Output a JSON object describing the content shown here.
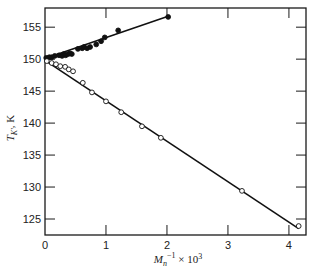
{
  "chart_data": {
    "type": "scatter",
    "title": "",
    "xlabel": "M_n^-1 × 10^3",
    "xlabel_parts": {
      "base": "M",
      "sub": "n",
      "sup": "−1",
      "rest": " × 10",
      "rest_sup": "3"
    },
    "ylabel": "T_K', K",
    "ylabel_parts": {
      "base": "T",
      "sub": "K'",
      "rest": ", K"
    },
    "xlim": [
      0,
      4.28
    ],
    "ylim": [
      122.5,
      158
    ],
    "xticks": [
      0,
      1,
      2,
      3,
      4
    ],
    "xtick_labels": [
      "0",
      "1",
      "2",
      "3",
      "4"
    ],
    "yticks": [
      125,
      130,
      135,
      140,
      145,
      150,
      155
    ],
    "ytick_labels": [
      "125",
      "130",
      "135",
      "140",
      "145",
      "150",
      "155"
    ],
    "grid": false,
    "series": [
      {
        "name": "filled",
        "marker": "filled-circle",
        "x": [
          0.02,
          0.07,
          0.11,
          0.16,
          0.23,
          0.28,
          0.31,
          0.34,
          0.38,
          0.41,
          0.44,
          0.54,
          0.61,
          0.64,
          0.69,
          0.74,
          0.84,
          0.92,
          0.98,
          1.2,
          2.02
        ],
        "y": [
          150.2,
          150.3,
          150.3,
          150.5,
          150.6,
          150.5,
          150.8,
          150.6,
          150.8,
          150.9,
          150.8,
          151.6,
          151.7,
          151.9,
          151.7,
          151.9,
          152.3,
          152.8,
          153.4,
          154.5,
          156.6
        ],
        "fit_line": {
          "x": [
            0,
            2.02
          ],
          "y": [
            150.1,
            156.7
          ]
        }
      },
      {
        "name": "open",
        "marker": "open-circle",
        "x": [
          0.03,
          0.11,
          0.18,
          0.25,
          0.33,
          0.39,
          0.46,
          0.62,
          0.77,
          1.0,
          1.25,
          1.59,
          1.9,
          3.23,
          4.16
        ],
        "y": [
          149.7,
          149.4,
          149.2,
          148.9,
          148.8,
          148.4,
          148.1,
          146.3,
          144.8,
          143.4,
          141.7,
          139.5,
          137.7,
          129.4,
          123.9
        ],
        "fit_line": {
          "x": [
            0,
            4.16
          ],
          "y": [
            149.8,
            123.5
          ]
        }
      }
    ]
  }
}
